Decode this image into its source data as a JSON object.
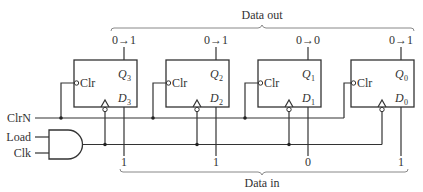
{
  "diagram": {
    "data_out_label": "Data out",
    "data_in_label": "Data in",
    "inputs": {
      "clrn": "ClrN",
      "load": "Load",
      "clk": "Clk"
    },
    "flip_flops": [
      {
        "clr": "Clr",
        "q": "Q",
        "q_sub": "3",
        "d": "D",
        "d_sub": "3",
        "out_transition": "0→1",
        "data_in": "1"
      },
      {
        "clr": "Clr",
        "q": "Q",
        "q_sub": "2",
        "d": "D",
        "d_sub": "2",
        "out_transition": "0→1",
        "data_in": "1"
      },
      {
        "clr": "Clr",
        "q": "Q",
        "q_sub": "1",
        "d": "D",
        "d_sub": "1",
        "out_transition": "0→0",
        "data_in": "0"
      },
      {
        "clr": "Clr",
        "q": "Q",
        "q_sub": "0",
        "d": "D",
        "d_sub": "0",
        "out_transition": "0→1",
        "data_in": "1"
      }
    ],
    "gate": {
      "type": "AND",
      "inputs": [
        "Load",
        "Clk"
      ]
    },
    "colors": {
      "wire": "#333333",
      "bracket": "#888888",
      "background": "#ffffff"
    }
  }
}
